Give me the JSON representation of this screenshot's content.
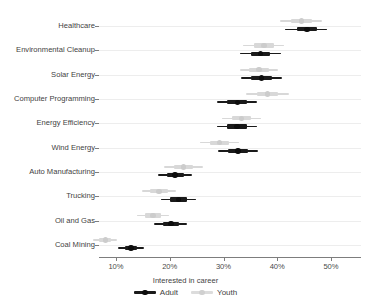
{
  "chart_data": {
    "type": "scatter",
    "title": "",
    "xlabel": "Interested in career",
    "ylabel": "",
    "xlim": [
      5,
      52
    ],
    "xticks": [
      10,
      20,
      30,
      40,
      50
    ],
    "xticklabels": [
      "10%",
      "20%",
      "30%",
      "40%",
      "50%"
    ],
    "grid": "horizontal",
    "legend_position": "bottom",
    "legend": [
      "Adult",
      "Youth"
    ],
    "categories": [
      "Healthcare",
      "Environmental Cleanup",
      "Solar Energy",
      "Computer Programming",
      "Energy Efficiency",
      "Wind Energy",
      "Auto Manufacturing",
      "Trucking",
      "Oil and Gas",
      "Coal Mining"
    ],
    "series": [
      {
        "name": "Adult",
        "color": "#1a1a1a",
        "estimates": [
          45.5,
          36.9,
          37.1,
          32.6,
          32.5,
          32.7,
          21.0,
          21.6,
          20.2,
          12.8
        ],
        "inner_low": [
          43.6,
          35.1,
          35.2,
          30.7,
          30.6,
          30.8,
          19.4,
          20.0,
          18.7,
          11.6
        ],
        "inner_high": [
          47.4,
          38.7,
          39.0,
          34.4,
          34.4,
          34.6,
          22.6,
          23.2,
          21.8,
          14.0
        ],
        "outer_low": [
          41.5,
          33.1,
          33.2,
          28.8,
          28.7,
          28.9,
          17.8,
          18.3,
          17.1,
          10.3
        ],
        "outer_high": [
          49.3,
          40.7,
          40.9,
          36.3,
          36.3,
          36.5,
          24.2,
          24.9,
          23.3,
          15.3
        ]
      },
      {
        "name": "Youth",
        "color": "#d8d8d8",
        "estimates": [
          44.5,
          37.5,
          36.6,
          38.2,
          33.3,
          29.2,
          22.5,
          18.0,
          16.9,
          8.0
        ],
        "inner_low": [
          42.6,
          35.6,
          34.8,
          36.2,
          31.5,
          27.4,
          20.7,
          16.4,
          15.4,
          6.9
        ],
        "inner_high": [
          46.4,
          39.4,
          38.4,
          40.2,
          35.1,
          31.0,
          24.3,
          19.6,
          18.4,
          9.1
        ],
        "outer_low": [
          40.6,
          33.7,
          33.0,
          34.2,
          29.7,
          25.6,
          18.9,
          14.8,
          13.9,
          5.8
        ],
        "outer_high": [
          48.4,
          41.3,
          40.2,
          42.2,
          36.9,
          32.8,
          26.1,
          21.2,
          19.9,
          10.2
        ]
      }
    ]
  },
  "colors": {
    "adult": "#1a1a1a",
    "youth": "#d8d8d8",
    "axis": "#7d7d7d",
    "grid": "#ededed",
    "text": "#3f3f3f",
    "background": "#ffffff"
  }
}
